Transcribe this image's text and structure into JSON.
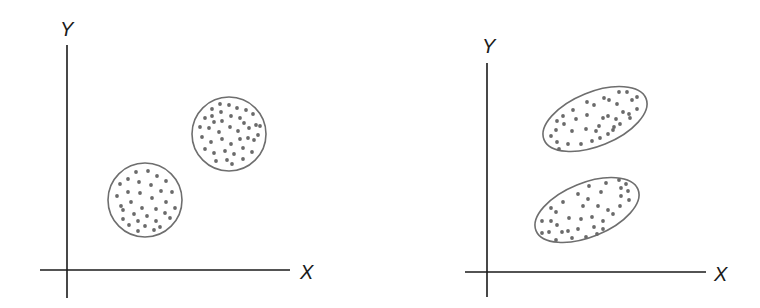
{
  "figure": {
    "left_panel": {
      "x_label": "X",
      "y_label": "Y",
      "description": "Two circular clusters with no correlation between X and Y within clusters"
    },
    "right_panel": {
      "x_label": "X",
      "y_label": "Y",
      "description": "Two elongated elliptical clusters showing positive correlation between X and Y within clusters"
    }
  },
  "colors": {
    "axis": "#1a1a1a",
    "outline": "#6e6e6e",
    "dot": "#6a6a6a",
    "background": "#ffffff"
  }
}
